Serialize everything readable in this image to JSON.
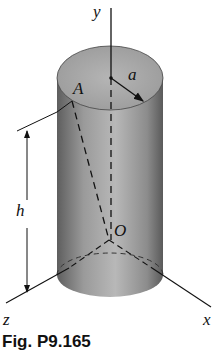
{
  "figure": {
    "caption": "Fig. P9.165",
    "labels": {
      "y_axis": "y",
      "x_axis": "x",
      "z_axis": "z",
      "point_a": "A",
      "origin": "O",
      "radius": "a",
      "height": "h"
    },
    "colors": {
      "cylinder_body": "#8a8a8a",
      "cylinder_top": "#a8a8a8",
      "line": "#111111"
    }
  }
}
